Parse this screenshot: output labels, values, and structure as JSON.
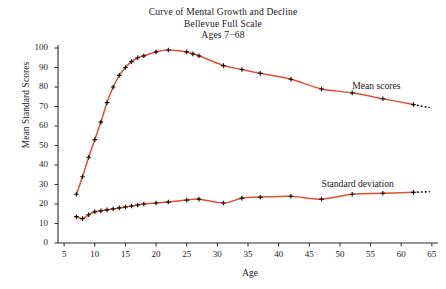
{
  "figure": {
    "title_lines": [
      "Curve of Mental Growth and Decline",
      "Bellevue Full Scale",
      "Ages 7−68"
    ]
  },
  "chart_data": {
    "type": "line",
    "title": "Curve of Mental Growth and Decline",
    "subtitle": "Bellevue Full Scale",
    "subtitle2": "Ages 7−68",
    "xlabel": "Age",
    "ylabel": "Mean Standard Scores",
    "xlim": [
      4,
      66
    ],
    "ylim": [
      0,
      100
    ],
    "xticks": [
      5,
      10,
      15,
      20,
      25,
      30,
      35,
      40,
      45,
      50,
      55,
      60,
      65
    ],
    "yticks": [
      0,
      10,
      20,
      30,
      40,
      50,
      60,
      70,
      80,
      90,
      100
    ],
    "grid": false,
    "legend": "inline-annotations",
    "line_color": "#e0512f",
    "marker": "plus",
    "marker_color": "#111111",
    "series": [
      {
        "name": "Mean scores",
        "label": "Mean scores",
        "label_x": 52.0,
        "label_y": 80.0,
        "dotted_tail": true,
        "x": [
          7,
          8,
          9,
          10,
          11,
          12,
          13,
          14,
          15,
          16,
          17,
          18,
          20,
          22,
          25,
          26,
          27,
          31,
          34,
          37,
          42,
          47,
          52,
          57,
          62
        ],
        "y": [
          25,
          34,
          44,
          53,
          62,
          72,
          80,
          86,
          90,
          93,
          95,
          96,
          98,
          99,
          98,
          97,
          96,
          91,
          89,
          87,
          84,
          79,
          77,
          74,
          71
        ]
      },
      {
        "name": "Standard deviation",
        "label": "Standard deviation",
        "label_x": 47.0,
        "label_y": 30.0,
        "dotted_tail": true,
        "x": [
          7,
          8,
          9,
          10,
          11,
          12,
          13,
          14,
          15,
          16,
          17,
          18,
          20,
          22,
          25,
          27,
          31,
          34,
          37,
          42,
          47,
          52,
          57,
          62
        ],
        "y": [
          13.5,
          12.5,
          14.5,
          16,
          16.5,
          17,
          17.5,
          18,
          18.5,
          19,
          19.5,
          20,
          20.5,
          21,
          22,
          22.5,
          20.5,
          23,
          23.5,
          24,
          22.5,
          25,
          25.5,
          26
        ]
      }
    ]
  }
}
